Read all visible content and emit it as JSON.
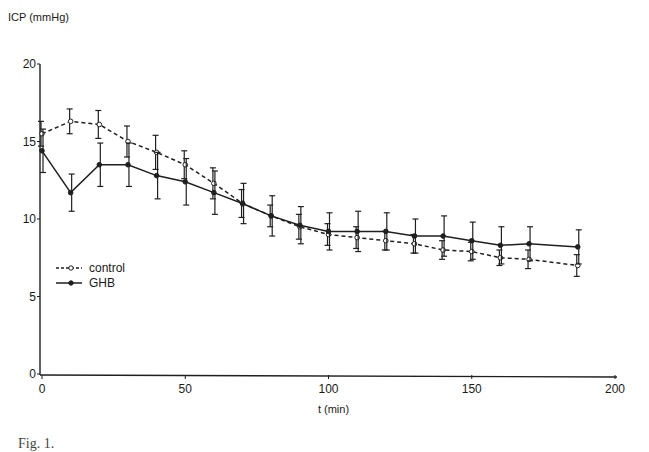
{
  "chart_data": {
    "type": "line",
    "title": "",
    "ylabel": "ICP (mmHg)",
    "xlabel": "t (min)",
    "ylim": [
      0,
      20
    ],
    "xlim": [
      0,
      200
    ],
    "yticks": [
      0,
      5,
      10,
      15,
      20
    ],
    "xticks": [
      0,
      50,
      100,
      150,
      200
    ],
    "grid": false,
    "legend_position": "left-middle",
    "x": [
      0,
      10,
      20,
      30,
      40,
      50,
      60,
      70,
      80,
      90,
      100,
      110,
      120,
      130,
      140,
      150,
      160,
      170,
      187
    ],
    "series": [
      {
        "name": "control",
        "style": "dashed",
        "marker": "open-circle",
        "values": [
          15.5,
          16.3,
          16.1,
          15.0,
          14.3,
          13.5,
          12.3,
          11.0,
          10.2,
          9.5,
          9.0,
          8.8,
          8.6,
          8.4,
          8.0,
          7.9,
          7.5,
          7.4,
          7.0
        ],
        "error": [
          0.8,
          0.8,
          0.9,
          1.0,
          1.1,
          0.9,
          1.0,
          0.9,
          0.7,
          0.8,
          0.7,
          0.7,
          0.6,
          0.6,
          0.6,
          0.6,
          0.5,
          0.6,
          0.7
        ]
      },
      {
        "name": "GHB",
        "style": "solid",
        "marker": "filled-circle",
        "values": [
          14.4,
          11.7,
          13.5,
          13.5,
          12.8,
          12.4,
          11.7,
          11.0,
          10.2,
          9.6,
          9.2,
          9.2,
          9.2,
          8.9,
          8.9,
          8.6,
          8.3,
          8.4,
          8.2
        ],
        "error": [
          1.4,
          1.2,
          1.4,
          1.4,
          1.5,
          1.5,
          1.4,
          1.3,
          1.3,
          1.2,
          1.2,
          1.3,
          1.2,
          1.1,
          1.3,
          1.2,
          1.2,
          1.1,
          1.1
        ]
      }
    ]
  },
  "labels": {
    "y_axis": "ICP (mmHg)",
    "x_axis": "t (min)",
    "legend_control": "control",
    "legend_ghb": "GHB",
    "caption_fragment": "Fig. 1."
  }
}
